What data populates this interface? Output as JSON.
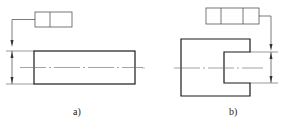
{
  "figures": [
    {
      "id": "a",
      "caption": "a)",
      "feature_control_frame": {
        "cells": 2
      },
      "shape": "rectangle"
    },
    {
      "id": "b",
      "caption": "b)",
      "feature_control_frame": {
        "cells": 3
      },
      "shape": "slotted-block"
    }
  ],
  "colors": {
    "line": "#1a1a1a",
    "thin_line": "#444444",
    "background": "#ffffff"
  }
}
